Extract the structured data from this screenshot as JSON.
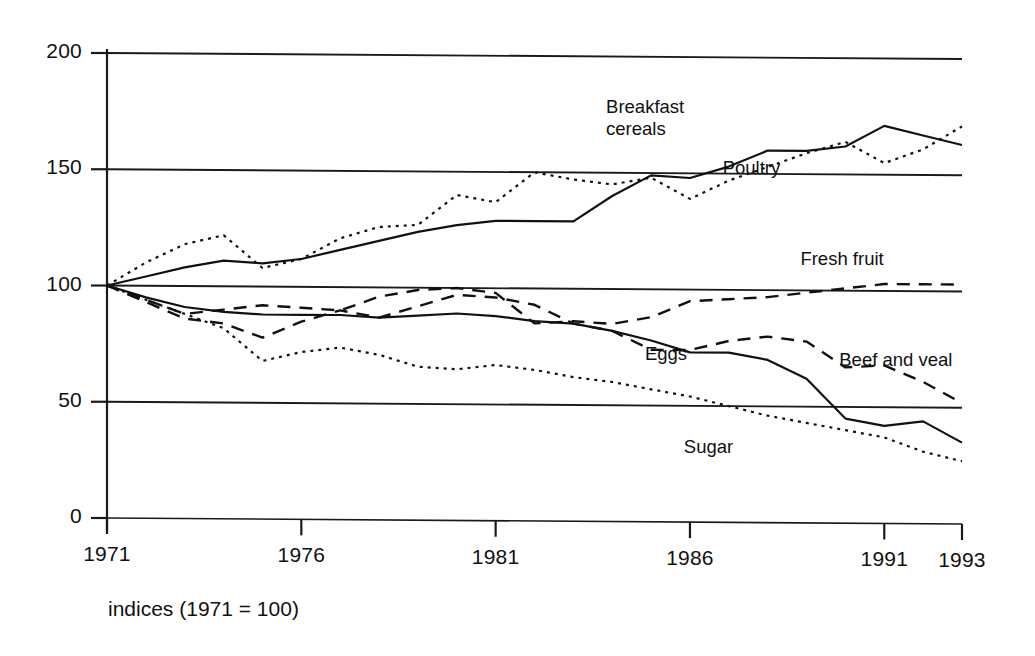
{
  "caption": "indices (1971 = 100)",
  "chart_data": {
    "type": "line",
    "title": "",
    "subtitle": "",
    "xlabel": "",
    "ylabel": "",
    "note": "indices (1971 = 100)",
    "grid": true,
    "legend_position": "inline-labels",
    "xlim": [
      1971,
      1993
    ],
    "ylim": [
      0,
      200
    ],
    "yticks": [
      0,
      50,
      100,
      150,
      200
    ],
    "ytick_labels": [
      "0",
      "50",
      "100",
      "150",
      "200"
    ],
    "xticks": [
      1971,
      1976,
      1981,
      1986,
      1991,
      1993
    ],
    "xtick_labels": [
      "1971",
      "1976",
      "1981",
      "1986",
      "1991",
      "1993"
    ],
    "x": [
      1971,
      1972,
      1973,
      1974,
      1975,
      1976,
      1977,
      1978,
      1979,
      1980,
      1981,
      1982,
      1983,
      1984,
      1985,
      1986,
      1987,
      1988,
      1989,
      1990,
      1991,
      1992,
      1993
    ],
    "series": [
      {
        "name": "Breakfast cereals",
        "style": "solid",
        "values": [
          100,
          104,
          108,
          111,
          110,
          112,
          116,
          120,
          124,
          127,
          129,
          129,
          129,
          140,
          149,
          148,
          153,
          160,
          160,
          162,
          171,
          167,
          163
        ]
      },
      {
        "name": "Poultry",
        "style": "dotted",
        "values": [
          100,
          110,
          118,
          122,
          108,
          112,
          121,
          126,
          127,
          140,
          137,
          150,
          147,
          145,
          148,
          139,
          147,
          153,
          159,
          164,
          155,
          161,
          171
        ]
      },
      {
        "name": "Fresh fruit",
        "style": "dashed",
        "values": [
          100,
          94,
          88,
          90,
          92,
          91,
          90,
          96,
          99,
          100,
          98,
          85,
          86,
          85,
          88,
          95,
          96,
          97,
          99,
          101,
          103,
          103,
          103
        ]
      },
      {
        "name": "Beef and veal",
        "style": "dashed",
        "values": [
          100,
          93,
          86,
          84,
          78,
          85,
          90,
          87,
          92,
          97,
          96,
          93,
          85,
          82,
          74,
          74,
          78,
          80,
          78,
          67,
          68,
          61,
          52
        ]
      },
      {
        "name": "Eggs",
        "style": "solid",
        "values": [
          100,
          95,
          91,
          89,
          88,
          88,
          88,
          87,
          88,
          89,
          88,
          86,
          85,
          82,
          78,
          73,
          73,
          70,
          62,
          45,
          42,
          44,
          35
        ]
      },
      {
        "name": "Sugar",
        "style": "dotted",
        "values": [
          100,
          94,
          88,
          82,
          68,
          72,
          74,
          71,
          66,
          65,
          67,
          65,
          62,
          60,
          57,
          54,
          50,
          46,
          43,
          40,
          37,
          31,
          27
        ]
      }
    ],
    "annotations": [
      {
        "text": "Breakfast\ncereals",
        "series": "Breakfast cereals",
        "x": 1985,
        "y": 178
      },
      {
        "text": "Poultry",
        "series": "Poultry",
        "x": 1988,
        "y": 152
      },
      {
        "text": "Fresh fruit",
        "series": "Fresh fruit",
        "x": 1990,
        "y": 113
      },
      {
        "text": "Beef and veal",
        "series": "Beef and veal",
        "x": 1991,
        "y": 70
      },
      {
        "text": "Eggs",
        "series": "Eggs",
        "x": 1986,
        "y": 72
      },
      {
        "text": "Sugar",
        "series": "Sugar",
        "x": 1987,
        "y": 32
      }
    ]
  }
}
